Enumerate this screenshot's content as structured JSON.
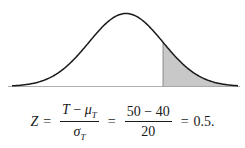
{
  "diagram": {
    "type": "normal-distribution-curve",
    "shaded_region": "right tail",
    "colors": {
      "curve": "#1a1a1a",
      "shade": "#c8c8c8",
      "baseline": "#888888"
    }
  },
  "formula": {
    "lhs": "Z",
    "eq1": "=",
    "frac1_num_var": "T",
    "frac1_num_op": "−",
    "frac1_num_mu": "μ",
    "frac1_num_mu_sub": "T",
    "frac1_den_sigma": "σ",
    "frac1_den_sigma_sub": "T",
    "eq2": "=",
    "frac2_num": "50 − 40",
    "frac2_den": "20",
    "eq3": "=",
    "result": "0.5."
  }
}
